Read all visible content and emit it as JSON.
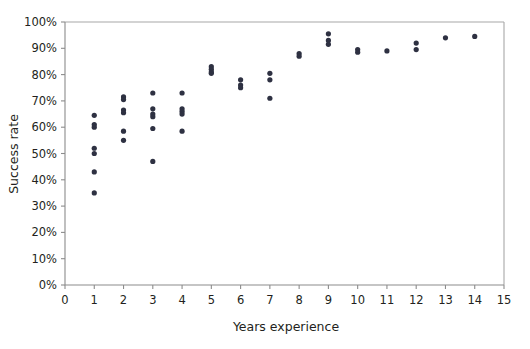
{
  "chart_data": {
    "type": "scatter",
    "title": "",
    "xlabel": "Years experience",
    "ylabel": "Success rate",
    "xlim": [
      0,
      15
    ],
    "ylim": [
      0,
      100
    ],
    "grid": false,
    "legend": null,
    "x_ticks": [
      "0",
      "1",
      "2",
      "3",
      "4",
      "5",
      "6",
      "7",
      "8",
      "9",
      "10",
      "11",
      "12",
      "13",
      "14",
      "15"
    ],
    "x_tick_values": [
      0,
      1,
      2,
      3,
      4,
      5,
      6,
      7,
      8,
      9,
      10,
      11,
      12,
      13,
      14,
      15
    ],
    "y_ticks": [
      "0%",
      "10%",
      "20%",
      "30%",
      "40%",
      "50%",
      "60%",
      "70%",
      "80%",
      "90%",
      "100%"
    ],
    "y_tick_values": [
      0,
      10,
      20,
      30,
      40,
      50,
      60,
      70,
      80,
      90,
      100
    ],
    "point_color": "#2e3142",
    "point_radius": 2.6,
    "points": [
      {
        "x": 1,
        "y": 64.5
      },
      {
        "x": 1,
        "y": 61.0
      },
      {
        "x": 1,
        "y": 60.0
      },
      {
        "x": 1,
        "y": 52.0
      },
      {
        "x": 1,
        "y": 50.0
      },
      {
        "x": 1,
        "y": 43.0
      },
      {
        "x": 1,
        "y": 35.0
      },
      {
        "x": 2,
        "y": 71.5
      },
      {
        "x": 2,
        "y": 70.5
      },
      {
        "x": 2,
        "y": 66.5
      },
      {
        "x": 2,
        "y": 65.5
      },
      {
        "x": 2,
        "y": 58.5
      },
      {
        "x": 2,
        "y": 55.0
      },
      {
        "x": 3,
        "y": 73.0
      },
      {
        "x": 3,
        "y": 67.0
      },
      {
        "x": 3,
        "y": 65.0
      },
      {
        "x": 3,
        "y": 64.0
      },
      {
        "x": 3,
        "y": 59.5
      },
      {
        "x": 3,
        "y": 47.0
      },
      {
        "x": 4,
        "y": 73.0
      },
      {
        "x": 4,
        "y": 67.0
      },
      {
        "x": 4,
        "y": 66.0
      },
      {
        "x": 4,
        "y": 65.0
      },
      {
        "x": 4,
        "y": 58.5
      },
      {
        "x": 5,
        "y": 83.0
      },
      {
        "x": 5,
        "y": 82.0
      },
      {
        "x": 5,
        "y": 81.0
      },
      {
        "x": 5,
        "y": 80.5
      },
      {
        "x": 6,
        "y": 78.0
      },
      {
        "x": 6,
        "y": 76.0
      },
      {
        "x": 6,
        "y": 75.0
      },
      {
        "x": 7,
        "y": 80.5
      },
      {
        "x": 7,
        "y": 78.0
      },
      {
        "x": 7,
        "y": 71.0
      },
      {
        "x": 8,
        "y": 88.0
      },
      {
        "x": 8,
        "y": 87.0
      },
      {
        "x": 9,
        "y": 95.5
      },
      {
        "x": 9,
        "y": 93.0
      },
      {
        "x": 9,
        "y": 91.5
      },
      {
        "x": 10,
        "y": 89.5
      },
      {
        "x": 10,
        "y": 88.5
      },
      {
        "x": 11,
        "y": 89.0
      },
      {
        "x": 12,
        "y": 92.0
      },
      {
        "x": 12,
        "y": 89.5
      },
      {
        "x": 13,
        "y": 94.0
      },
      {
        "x": 14,
        "y": 94.5
      }
    ]
  }
}
